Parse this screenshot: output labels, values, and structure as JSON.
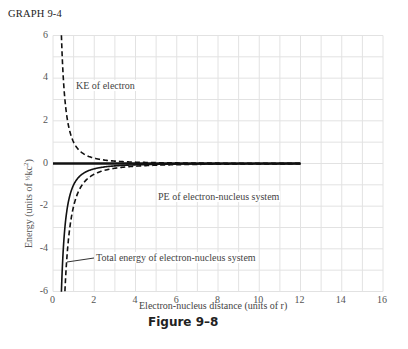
{
  "header": {
    "graph_label": "GRAPH 9-4"
  },
  "caption": "Figure 9–8",
  "axes": {
    "xlabel": "Electron-nucleus distance (units of r)",
    "ylabel_text": "Energy (units of ½kc²)",
    "xticks": [
      "0",
      "2",
      "4",
      "6",
      "8",
      "10",
      "12",
      "14",
      "16"
    ],
    "yticks": [
      "6",
      "4",
      "2",
      "0",
      "-2",
      "-4",
      "-6"
    ]
  },
  "annotations": {
    "ke": "KE of electron",
    "pe": "PE of electron-nucleus system",
    "total": "Total energy of electron-nucleus system"
  },
  "chart_data": {
    "type": "line",
    "title": "GRAPH 9-4",
    "caption": "Figure 9–8",
    "xlabel": "Electron-nucleus distance (units of r)",
    "ylabel": "Energy (units of ½kc²)",
    "xlim": [
      0,
      16
    ],
    "ylim": [
      -6,
      6
    ],
    "xticks": [
      0,
      2,
      4,
      6,
      8,
      10,
      12,
      14,
      16
    ],
    "yticks": [
      -6,
      -4,
      -2,
      0,
      2,
      4,
      6
    ],
    "grid": true,
    "legend": "inline annotations",
    "series": [
      {
        "name": "KE of electron",
        "style": "dashed",
        "x": [
          0.41,
          0.5,
          0.75,
          1,
          1.5,
          2,
          3,
          4,
          6,
          8,
          10,
          12
        ],
        "y": [
          6.0,
          4.0,
          1.78,
          1.0,
          0.44,
          0.25,
          0.11,
          0.06,
          0.03,
          0.02,
          0.01,
          0.01
        ]
      },
      {
        "name": "Zero energy line",
        "style": "solid-thick",
        "x": [
          0,
          12
        ],
        "y": [
          0,
          0
        ]
      },
      {
        "name": "Total energy of electron-nucleus system",
        "style": "solid",
        "x": [
          0.41,
          0.5,
          0.75,
          1,
          1.5,
          2,
          3,
          4,
          6,
          8,
          10,
          12
        ],
        "y": [
          -6.0,
          -4.0,
          -1.78,
          -1.0,
          -0.44,
          -0.25,
          -0.11,
          -0.06,
          -0.03,
          -0.02,
          -0.01,
          -0.01
        ]
      },
      {
        "name": "PE of electron-nucleus system",
        "style": "dashed",
        "x": [
          0.58,
          0.75,
          1,
          1.5,
          2,
          3,
          4,
          6,
          8,
          10,
          12
        ],
        "y": [
          -6.0,
          -3.56,
          -2.0,
          -0.89,
          -0.5,
          -0.22,
          -0.13,
          -0.06,
          -0.03,
          -0.02,
          -0.01
        ]
      }
    ]
  }
}
